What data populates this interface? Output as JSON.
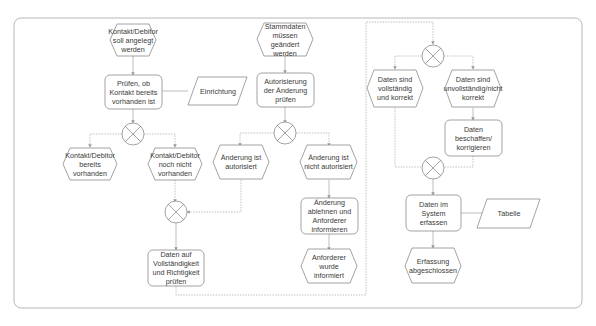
{
  "diagram": {
    "type": "EPC process flow",
    "colors": {
      "stroke": "#8a8a8a",
      "frame": "#b5b5b5",
      "text": "#3a3a3a",
      "background": "#ffffff"
    },
    "nodes": {
      "e_kontakt_anlegen": {
        "kind": "event",
        "label": "Kontakt/Debitor soll angelegt werden"
      },
      "f_pruefen_kontakt": {
        "kind": "function",
        "label": "Prüfen, ob Kontakt bereits vorhanden ist"
      },
      "d_einrichtung": {
        "kind": "data",
        "label": "Einrichtung"
      },
      "x_kontakt": {
        "kind": "xor",
        "label": "XOR"
      },
      "e_kontakt_vorhanden": {
        "kind": "event",
        "label": "Kontakt/Debitor bereits vorhanden"
      },
      "e_kontakt_nicht": {
        "kind": "event",
        "label": "Kontakt/Debitor noch nicht vorhanden"
      },
      "e_stammdaten": {
        "kind": "event",
        "label": "Stammdaten müssen geändert werden"
      },
      "f_autorisierung": {
        "kind": "function",
        "label": "Autorisierung der Änderung prüfen"
      },
      "x_autorisierung": {
        "kind": "xor",
        "label": "XOR"
      },
      "e_autorisiert": {
        "kind": "event",
        "label": "Änderung ist autorisiert"
      },
      "e_nicht_autorisiert": {
        "kind": "event",
        "label": "Änderung ist nicht autorisiert"
      },
      "f_ablehnen": {
        "kind": "function",
        "label": "Änderung ablehnen und Anforderer informieren"
      },
      "e_informiert": {
        "kind": "event",
        "label": "Anforderer wurde informiert"
      },
      "x_merge1": {
        "kind": "xor",
        "label": "XOR"
      },
      "f_daten_pruefen": {
        "kind": "function",
        "label": "Daten auf Vollständigkeit und Richtigkeit prüfen"
      },
      "x_daten": {
        "kind": "xor",
        "label": "XOR"
      },
      "e_daten_korrekt": {
        "kind": "event",
        "label": "Daten sind vollständig und korrekt"
      },
      "e_daten_unvollst": {
        "kind": "event",
        "label": "Daten sind unvollständig/nicht korrekt"
      },
      "f_beschaffen": {
        "kind": "function",
        "label": "Daten beschaffen/ korrigieren"
      },
      "x_merge2": {
        "kind": "xor",
        "label": "XOR"
      },
      "f_erfassen": {
        "kind": "function",
        "label": "Daten im System erfassen"
      },
      "d_tabelle": {
        "kind": "data",
        "label": "Tabelle"
      },
      "e_abgeschlossen": {
        "kind": "event",
        "label": "Erfassung abgeschlossen"
      }
    },
    "edges": [
      [
        "e_kontakt_anlegen",
        "f_pruefen_kontakt"
      ],
      [
        "f_pruefen_kontakt",
        "d_einrichtung"
      ],
      [
        "f_pruefen_kontakt",
        "x_kontakt"
      ],
      [
        "x_kontakt",
        "e_kontakt_vorhanden"
      ],
      [
        "x_kontakt",
        "e_kontakt_nicht"
      ],
      [
        "e_stammdaten",
        "f_autorisierung"
      ],
      [
        "f_autorisierung",
        "x_autorisierung"
      ],
      [
        "x_autorisierung",
        "e_autorisiert"
      ],
      [
        "x_autorisierung",
        "e_nicht_autorisiert"
      ],
      [
        "e_nicht_autorisiert",
        "f_ablehnen"
      ],
      [
        "f_ablehnen",
        "e_informiert"
      ],
      [
        "e_kontakt_nicht",
        "x_merge1"
      ],
      [
        "e_autorisiert",
        "x_merge1"
      ],
      [
        "x_merge1",
        "f_daten_pruefen"
      ],
      [
        "f_daten_pruefen",
        "x_daten"
      ],
      [
        "x_daten",
        "e_daten_korrekt"
      ],
      [
        "x_daten",
        "e_daten_unvollst"
      ],
      [
        "e_daten_unvollst",
        "f_beschaffen"
      ],
      [
        "f_beschaffen",
        "x_merge2"
      ],
      [
        "e_daten_korrekt",
        "x_merge2"
      ],
      [
        "x_merge2",
        "f_erfassen"
      ],
      [
        "f_erfassen",
        "d_tabelle"
      ],
      [
        "f_erfassen",
        "e_abgeschlossen"
      ]
    ]
  }
}
